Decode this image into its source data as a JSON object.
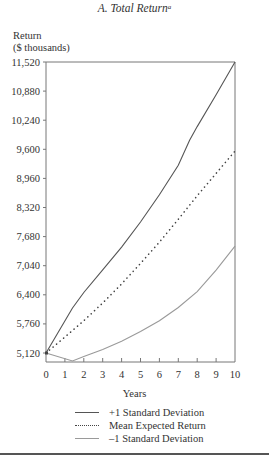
{
  "title": "A. Total Return",
  "title_footnote": "a",
  "y_axis_label_line1": "Return",
  "y_axis_label_line2": "($ thousands)",
  "x_axis_label": "Years",
  "legend": [
    {
      "label": "+1 Standard Deviation",
      "style": "solid-dark"
    },
    {
      "label": "Mean Expected Return",
      "style": "dotted"
    },
    {
      "label": "–1 Standard Deviation",
      "style": "solid-light"
    }
  ],
  "colors": {
    "upper": "#555555",
    "mean": "#444444",
    "lower": "#9a9a9a",
    "axis": "#777777"
  },
  "chart_data": {
    "type": "line",
    "title": "A. Total Return",
    "xlabel": "Years",
    "ylabel": "Return ($ thousands)",
    "xlim": [
      0,
      10
    ],
    "ylim": [
      5120,
      11520
    ],
    "x_ticks": [
      0,
      1,
      2,
      3,
      4,
      5,
      6,
      7,
      8,
      9,
      10
    ],
    "y_ticks": [
      5120,
      5760,
      6400,
      7040,
      7680,
      8320,
      8960,
      9600,
      10240,
      10880,
      11520
    ],
    "y_tick_labels": [
      "5,120",
      "5,760",
      "6,400",
      "7,040",
      "7,680",
      "8,320",
      "8,960",
      "9,600",
      "10,240",
      "10,880",
      "11,520"
    ],
    "grid": false,
    "legend_position": "bottom",
    "series": [
      {
        "name": "+1 Standard Deviation",
        "x": [
          0,
          1.4,
          2,
          3,
          4,
          5,
          6,
          7,
          7.6,
          8,
          9,
          10
        ],
        "values": [
          5120,
          6110,
          6450,
          6950,
          7450,
          8000,
          8600,
          9250,
          9800,
          10100,
          10800,
          11520
        ]
      },
      {
        "name": "Mean Expected Return",
        "x": [
          0,
          1,
          2,
          3,
          4,
          5,
          6,
          7,
          8,
          9,
          10
        ],
        "values": [
          5120,
          5470,
          5830,
          6220,
          6640,
          7090,
          7560,
          8060,
          8580,
          9070,
          9560
        ]
      },
      {
        "name": "–1 Standard Deviation",
        "x": [
          0,
          1.4,
          2,
          3,
          4,
          5,
          6,
          7,
          8,
          9,
          10
        ],
        "values": [
          5120,
          4945,
          5040,
          5200,
          5380,
          5590,
          5830,
          6120,
          6470,
          6940,
          7470
        ]
      }
    ]
  }
}
